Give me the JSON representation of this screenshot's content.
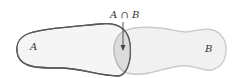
{
  "diagram": {
    "type": "venn",
    "sets": [
      {
        "name": "A",
        "label": "A",
        "outline_color": "#5a5a5a",
        "fill": "#f2f2f2"
      },
      {
        "name": "B",
        "label": "B",
        "outline_color": "#c8c8c8",
        "fill": "#f0f0f0"
      }
    ],
    "intersection": {
      "label": "A ∩ B",
      "fill": "#dedede"
    },
    "arrow_color": "#444444"
  }
}
